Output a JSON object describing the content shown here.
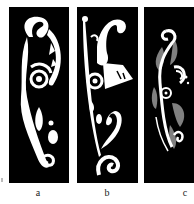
{
  "figure": {
    "panels": [
      {
        "id": "a",
        "label": "a",
        "description": "white swirl ornament on black, with spiral, leaf and dot shapes"
      },
      {
        "id": "b",
        "label": "b",
        "description": "white swirl ornament on black, long stem with curls and a wedge shape"
      },
      {
        "id": "c",
        "label": "c",
        "description": "white and gray swirl ornament on black, with concentric curls"
      }
    ],
    "colors": {
      "background": "#ffffff",
      "panel": "#000000",
      "primary_motif": "#ffffff",
      "secondary_motif": "#808080"
    }
  }
}
